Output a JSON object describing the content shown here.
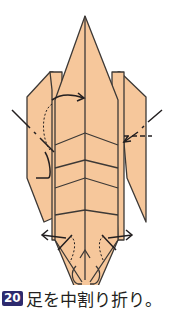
{
  "step": {
    "number": "20",
    "instruction": "足を中割り折り。"
  },
  "diagram": {
    "fill_color": "#f6c79b",
    "line_color": "#3d3936",
    "badge_color": "#2d2a6e",
    "icons": [
      "fold-arrow-right",
      "valley-fold-line-left",
      "valley-fold-line-right",
      "spread-arrow-left",
      "spread-arrow-right"
    ]
  }
}
